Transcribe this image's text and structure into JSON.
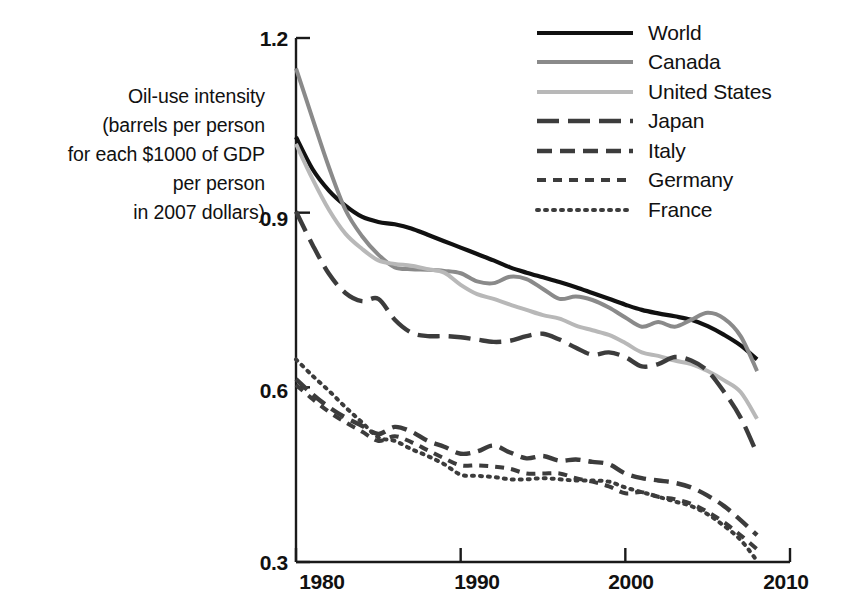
{
  "chart_data": {
    "type": "line",
    "title": "",
    "xlabel": "",
    "ylabel": "Oil-use intensity (barrels per person for each $1000 of GDP per person in 2007 dollars)",
    "ylabel_lines": [
      "Oil-use intensity",
      "(barrels per person",
      "for each $1000 of GDP",
      "per person",
      "in 2007 dollars)"
    ],
    "xlim": [
      1980,
      2010
    ],
    "ylim": [
      0.3,
      1.2
    ],
    "xticks": [
      1980,
      1990,
      2000,
      2010
    ],
    "xtick_labels": [
      "1980",
      "1990",
      "2000",
      "2010"
    ],
    "yticks": [
      0.3,
      0.6,
      0.9,
      1.2
    ],
    "ytick_labels": [
      "0.3",
      "0.6",
      "0.9",
      "1.2"
    ],
    "grid": false,
    "legend_position": "top-right",
    "x": [
      1980,
      1981,
      1982,
      1983,
      1984,
      1985,
      1986,
      1987,
      1988,
      1989,
      1990,
      1991,
      1992,
      1993,
      1994,
      1995,
      1996,
      1997,
      1998,
      1999,
      2000,
      2001,
      2002,
      2003,
      2004,
      2005,
      2006,
      2007,
      2008
    ],
    "series": [
      {
        "name": "World",
        "color": "#111111",
        "style": "solid",
        "width": 4.2,
        "values": [
          1.03,
          0.975,
          0.938,
          0.912,
          0.893,
          0.884,
          0.88,
          0.873,
          0.862,
          0.851,
          0.84,
          0.829,
          0.818,
          0.806,
          0.797,
          0.789,
          0.781,
          0.772,
          0.762,
          0.752,
          0.742,
          0.733,
          0.727,
          0.722,
          0.716,
          0.705,
          0.69,
          0.672,
          0.648
        ]
      },
      {
        "name": "Canada",
        "color": "#8a8a8a",
        "style": "solid",
        "width": 4.0,
        "values": [
          1.148,
          1.062,
          0.978,
          0.905,
          0.86,
          0.828,
          0.806,
          0.803,
          0.802,
          0.8,
          0.796,
          0.782,
          0.779,
          0.79,
          0.786,
          0.769,
          0.752,
          0.756,
          0.75,
          0.737,
          0.72,
          0.704,
          0.712,
          0.704,
          0.716,
          0.728,
          0.718,
          0.688,
          0.628
        ]
      },
      {
        "name": "United States",
        "color": "#b8b8b8",
        "style": "solid",
        "width": 4.0,
        "values": [
          1.018,
          0.958,
          0.905,
          0.864,
          0.838,
          0.818,
          0.812,
          0.809,
          0.803,
          0.797,
          0.776,
          0.76,
          0.752,
          0.742,
          0.733,
          0.724,
          0.718,
          0.706,
          0.698,
          0.69,
          0.676,
          0.66,
          0.654,
          0.646,
          0.64,
          0.628,
          0.612,
          0.592,
          0.546
        ]
      },
      {
        "name": "Japan",
        "color": "#3c3c3c",
        "style": "long-dash",
        "width": 4.4,
        "values": [
          0.902,
          0.845,
          0.795,
          0.762,
          0.748,
          0.752,
          0.716,
          0.694,
          0.688,
          0.688,
          0.686,
          0.682,
          0.678,
          0.68,
          0.688,
          0.692,
          0.682,
          0.668,
          0.656,
          0.66,
          0.652,
          0.636,
          0.64,
          0.652,
          0.646,
          0.628,
          0.592,
          0.548,
          0.486
        ]
      },
      {
        "name": "Italy",
        "color": "#3c3c3c",
        "style": "dash",
        "width": 4.4,
        "values": [
          0.614,
          0.588,
          0.566,
          0.548,
          0.534,
          0.52,
          0.532,
          0.524,
          0.508,
          0.498,
          0.486,
          0.49,
          0.5,
          0.488,
          0.478,
          0.482,
          0.474,
          0.476,
          0.472,
          0.468,
          0.452,
          0.444,
          0.44,
          0.436,
          0.428,
          0.414,
          0.396,
          0.372,
          0.346
        ]
      },
      {
        "name": "Germany",
        "color": "#3c3c3c",
        "style": "short-dash",
        "width": 4.0,
        "values": [
          0.604,
          0.58,
          0.558,
          0.54,
          0.524,
          0.508,
          0.516,
          0.506,
          0.492,
          0.478,
          0.466,
          0.466,
          0.464,
          0.46,
          0.452,
          0.452,
          0.452,
          0.444,
          0.438,
          0.43,
          0.418,
          0.42,
          0.412,
          0.408,
          0.4,
          0.386,
          0.368,
          0.346,
          0.322
        ]
      },
      {
        "name": "France",
        "color": "#3c3c3c",
        "style": "dot",
        "width": 4.0,
        "values": [
          0.648,
          0.62,
          0.594,
          0.566,
          0.54,
          0.514,
          0.508,
          0.494,
          0.482,
          0.468,
          0.45,
          0.448,
          0.446,
          0.442,
          0.442,
          0.444,
          0.442,
          0.44,
          0.44,
          0.438,
          0.428,
          0.42,
          0.412,
          0.404,
          0.396,
          0.382,
          0.362,
          0.338,
          0.302
        ]
      }
    ]
  },
  "legend": {
    "items": [
      {
        "label": "World"
      },
      {
        "label": "Canada"
      },
      {
        "label": "United States"
      },
      {
        "label": "Japan"
      },
      {
        "label": "Italy"
      },
      {
        "label": "Germany"
      },
      {
        "label": "France"
      }
    ]
  }
}
